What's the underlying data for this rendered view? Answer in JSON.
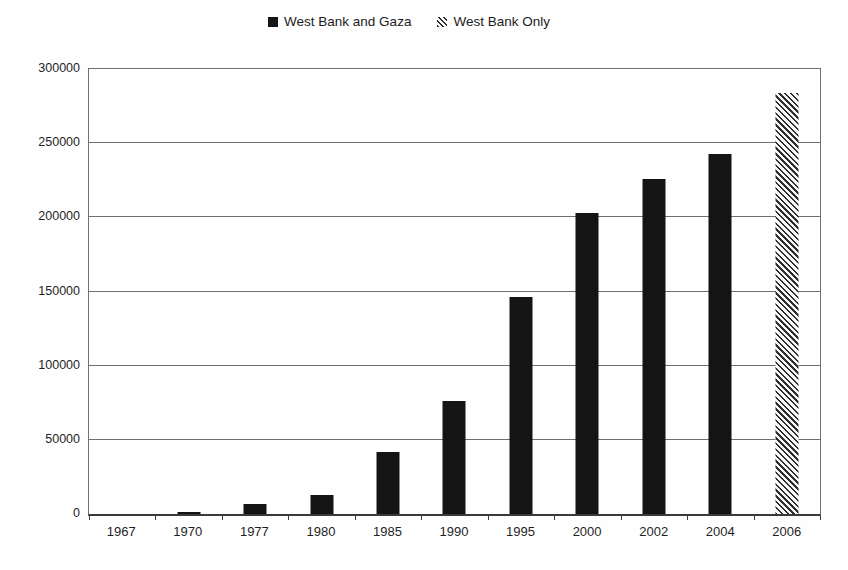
{
  "legend": {
    "items": [
      {
        "label": "West Bank and Gaza",
        "marker": "solid-black-square",
        "color": "#141414"
      },
      {
        "label": "West Bank Only",
        "marker": "diagonal-hatch-square",
        "color": "#2f2f2f"
      }
    ]
  },
  "chart_data": {
    "type": "bar",
    "title": "",
    "xlabel": "",
    "ylabel": "",
    "categories": [
      "1967",
      "1970",
      "1977",
      "1980",
      "1985",
      "1990",
      "1995",
      "2000",
      "2002",
      "2004",
      "2006"
    ],
    "series": [
      {
        "name": "West Bank and Gaza",
        "style": "solid",
        "values": [
          0,
          1500,
          7000,
          12500,
          42000,
          76000,
          146000,
          203000,
          226000,
          243000,
          null
        ]
      },
      {
        "name": "West Bank Only",
        "style": "hatched",
        "values": [
          null,
          null,
          null,
          null,
          null,
          null,
          null,
          null,
          null,
          null,
          284000
        ]
      }
    ],
    "ylim": [
      0,
      300000
    ],
    "ytick_interval": 50000,
    "ytick_labels": [
      "0",
      "50000",
      "100000",
      "150000",
      "200000",
      "250000",
      "300000"
    ],
    "grid": true,
    "legend_position": "top-center",
    "bar_color": "#141414",
    "hatch_pattern": "light-downward-diagonal"
  }
}
